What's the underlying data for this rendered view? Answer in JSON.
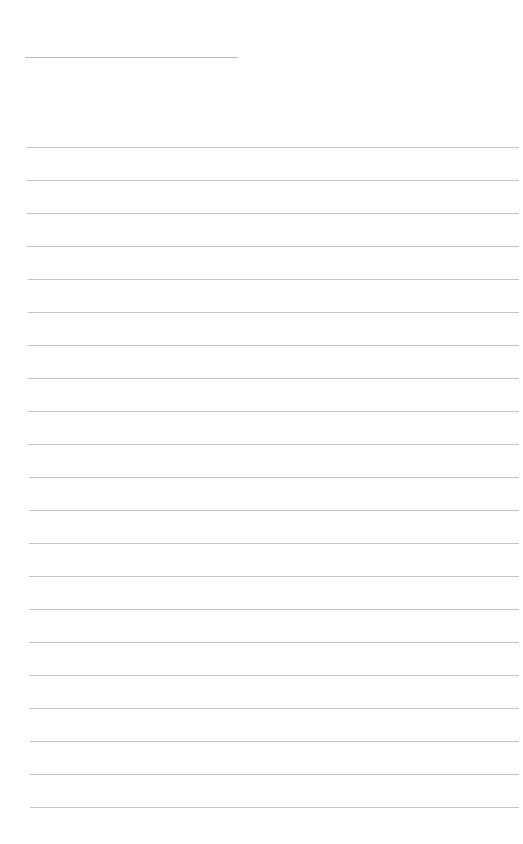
{
  "page": {
    "type": "lined-paper",
    "background_color": "#ffffff",
    "rule_color": "#c4c4c4",
    "header_rule": {
      "x": 25,
      "y": 57,
      "width": 213
    },
    "body_rules": {
      "count": 21,
      "first_y": 147,
      "spacing": 33,
      "x_start": 27,
      "x_end": 519
    }
  }
}
